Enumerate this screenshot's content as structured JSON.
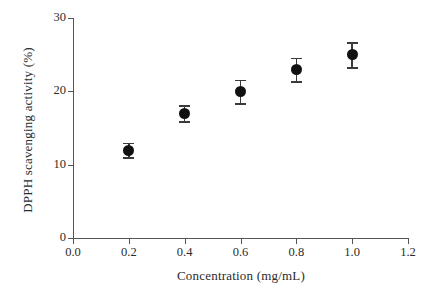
{
  "chart_data": {
    "type": "scatter",
    "title": "",
    "xlabel": "Concentration (mg/mL)",
    "ylabel": "DPPH scavenging activity (%)",
    "xlim": [
      0.0,
      1.2
    ],
    "ylim": [
      0,
      30
    ],
    "xticks": [
      "0.0",
      "0.2",
      "0.4",
      "0.6",
      "0.8",
      "1.0",
      "1.2"
    ],
    "xtick_values": [
      0.0,
      0.2,
      0.4,
      0.6,
      0.8,
      1.0,
      1.2
    ],
    "yticks": [
      "0",
      "10",
      "20",
      "30"
    ],
    "ytick_values": [
      0,
      10,
      20,
      30
    ],
    "grid": false,
    "legend": null,
    "errorbars": true,
    "x": [
      0.2,
      0.4,
      0.6,
      0.8,
      1.0
    ],
    "values": [
      12.0,
      17.0,
      20.0,
      23.0,
      25.0
    ],
    "errors": [
      1.0,
      1.1,
      1.6,
      1.6,
      1.7
    ],
    "points": [
      {
        "x": 0.2,
        "y": 12.0,
        "err": 1.0
      },
      {
        "x": 0.4,
        "y": 17.0,
        "err": 1.1
      },
      {
        "x": 0.6,
        "y": 20.0,
        "err": 1.6
      },
      {
        "x": 0.8,
        "y": 23.0,
        "err": 1.6
      },
      {
        "x": 1.0,
        "y": 25.0,
        "err": 1.7
      }
    ],
    "marker_color": "#111111",
    "errorbar_color": "#3a3a3a",
    "axis_color": "#555555",
    "background": "#ffffff"
  }
}
